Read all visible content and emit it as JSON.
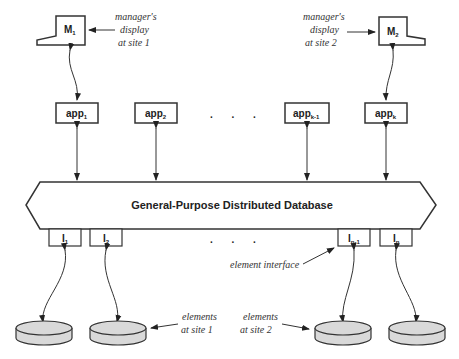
{
  "diagram": {
    "database_label": "General-Purpose Distributed Database",
    "managers": [
      {
        "label": "M",
        "sub": "1",
        "annotation": [
          "manager's",
          "display",
          "at site 1"
        ]
      },
      {
        "label": "M",
        "sub": "2",
        "annotation": [
          "manager's",
          "display",
          "at site 2"
        ]
      }
    ],
    "apps": [
      {
        "label": "app",
        "sub": "1"
      },
      {
        "label": "app",
        "sub": "2"
      },
      {
        "label": "app",
        "sub": "k-1"
      },
      {
        "label": "app",
        "sub": "k"
      }
    ],
    "interfaces": [
      {
        "label": "I",
        "sub": "1"
      },
      {
        "label": "I",
        "sub": "2"
      },
      {
        "label": "I",
        "sub": "n-1"
      },
      {
        "label": "I",
        "sub": "n"
      }
    ],
    "ellipsis_apps": ". . .",
    "ellipsis_interfaces": ". . .",
    "element_interface_annotation": "element interface",
    "elements_site1_annotation": [
      "elements",
      "at site 1"
    ],
    "elements_site2_annotation": [
      "elements",
      "at site 2"
    ],
    "colors": {
      "stroke": "#333333",
      "disk_fill": "#d9d9d9",
      "background": "#ffffff"
    }
  }
}
